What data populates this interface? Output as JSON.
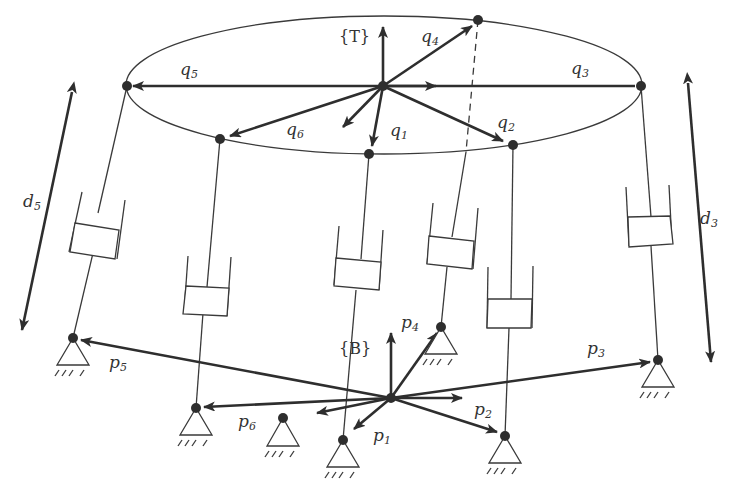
{
  "diagram": {
    "frames": {
      "top": "{T}",
      "base": "{B}"
    },
    "top_vectors": [
      {
        "name": "q",
        "sub": "1"
      },
      {
        "name": "q",
        "sub": "2"
      },
      {
        "name": "q",
        "sub": "3"
      },
      {
        "name": "q",
        "sub": "4"
      },
      {
        "name": "q",
        "sub": "5"
      },
      {
        "name": "q",
        "sub": "6"
      }
    ],
    "base_vectors": [
      {
        "name": "p",
        "sub": "1"
      },
      {
        "name": "p",
        "sub": "2"
      },
      {
        "name": "p",
        "sub": "3"
      },
      {
        "name": "p",
        "sub": "4"
      },
      {
        "name": "p",
        "sub": "5"
      },
      {
        "name": "p",
        "sub": "6"
      }
    ],
    "leg_lengths": [
      {
        "name": "d",
        "sub": "5"
      },
      {
        "name": "d",
        "sub": "3"
      }
    ],
    "colors": {
      "ink": "#2e2e2e",
      "background": "#ffffff"
    }
  }
}
